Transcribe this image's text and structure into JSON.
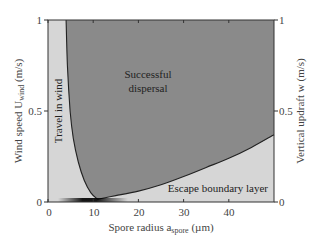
{
  "chart_data": {
    "type": "area",
    "title": "",
    "xlabel": "Spore radius a_spore (µm)",
    "xlabel_parts": {
      "main": "Spore radius a",
      "sub": "spore",
      "unit": " (µm)"
    },
    "ylabel_left": "Wind speed U_wind (m/s)",
    "ylabel_left_parts": {
      "main": "Wind speed U",
      "sub": "wind",
      "unit": " (m/s)"
    },
    "ylabel_right": "Vertical updraft w (m/s)",
    "xlim": [
      0,
      50
    ],
    "ylim_left": [
      0,
      1
    ],
    "ylim_right": [
      0,
      1
    ],
    "x_ticks": [
      0,
      10,
      20,
      30,
      40
    ],
    "y_ticks_left": [
      0,
      0.5,
      1
    ],
    "y_ticks_right": [
      0,
      0.5,
      1
    ],
    "y_tick_labels_left": [
      "0",
      "0.5",
      "1"
    ],
    "y_tick_labels_right": [
      "0",
      "0.5",
      "1"
    ],
    "x_tick_labels": [
      "0",
      "10",
      "20",
      "30",
      "40"
    ],
    "grid": false,
    "regions": [
      {
        "name": "Travel in wind",
        "color": "#d6d6d6"
      },
      {
        "name": "Successful dispersal",
        "color": "#8a8a8a"
      },
      {
        "name": "Escape boundary layer",
        "color": "#d9d9d9"
      }
    ],
    "series": [
      {
        "name": "Travel-in-wind boundary (wind speed vs spore radius)",
        "x": [
          4.0,
          4.3,
          4.9,
          5.6,
          6.7,
          8.0,
          9.5,
          11.0
        ],
        "y": [
          1.0,
          0.75,
          0.5,
          0.35,
          0.22,
          0.12,
          0.05,
          0.015
        ]
      },
      {
        "name": "Escape-boundary-layer boundary (updraft vs spore radius)",
        "x": [
          11.0,
          15.0,
          20.0,
          25.0,
          30.0,
          35.0,
          40.0,
          45.0,
          50.0
        ],
        "y": [
          0.015,
          0.035,
          0.06,
          0.095,
          0.14,
          0.19,
          0.24,
          0.3,
          0.37
        ]
      }
    ],
    "annotations": [
      {
        "text": "Successful dispersal",
        "x": 19,
        "y": 0.72
      },
      {
        "text": "Travel in wind",
        "x": 2.2,
        "y": 0.5,
        "rotation": -90
      },
      {
        "text": "Escape boundary layer",
        "x": 39,
        "y": 0.07
      }
    ]
  },
  "labels": {
    "region_success_line1": "Successful",
    "region_success_line2": "dispersal",
    "region_travel": "Travel in wind",
    "region_escape": "Escape boundary layer",
    "x_main": "Spore radius a",
    "x_sub": "spore",
    "x_unit": " (µm)",
    "yl_main": "Wind speed U",
    "yl_sub": "wind",
    "yl_unit": " (m/s)",
    "yr": "Vertical updraft w (m/s)"
  },
  "colors": {
    "light_region": "#d6d6d6",
    "dark_region": "#8a8a8a",
    "curve": "#222222",
    "frame": "#333333"
  }
}
